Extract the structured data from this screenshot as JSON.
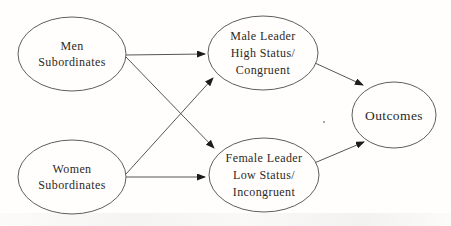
{
  "figure": {
    "background_color": "#fffefd",
    "ellipse_stroke_color": "#5e5e5e",
    "arrow_line_color": "#555555",
    "arrowhead_color": "#1c1c1c",
    "text_color": "#2d2925",
    "nodes": [
      {
        "id": "men-subordinates",
        "label_lines": [
          "Men",
          "Subordinates"
        ],
        "cx": 72,
        "cy": 54,
        "rx": 54,
        "ry": 37
      },
      {
        "id": "women-subordinates",
        "label_lines": [
          "Women",
          "Subordinates"
        ],
        "cx": 72,
        "cy": 177,
        "rx": 54,
        "ry": 37
      },
      {
        "id": "male-leader",
        "label_lines": [
          "Male Leader",
          "High Status/",
          "Congruent"
        ],
        "cx": 263,
        "cy": 53,
        "rx": 55,
        "ry": 37
      },
      {
        "id": "female-leader",
        "label_lines": [
          "Female Leader",
          "Low Status/",
          "Incongruent"
        ],
        "cx": 264,
        "cy": 175,
        "rx": 55,
        "ry": 37
      },
      {
        "id": "outcomes",
        "label_lines": [
          "Outcomes"
        ],
        "cx": 394,
        "cy": 115,
        "rx": 42,
        "ry": 33
      }
    ],
    "edges": [
      {
        "from": "men-subordinates",
        "to": "male-leader",
        "x1": 126,
        "y1": 55,
        "x2": 205,
        "y2": 54
      },
      {
        "from": "men-subordinates",
        "to": "female-leader",
        "x1": 126,
        "y1": 57,
        "x2": 214,
        "y2": 148
      },
      {
        "from": "women-subordinates",
        "to": "male-leader",
        "x1": 126,
        "y1": 174,
        "x2": 213,
        "y2": 78
      },
      {
        "from": "women-subordinates",
        "to": "female-leader",
        "x1": 126,
        "y1": 177,
        "x2": 205,
        "y2": 177
      },
      {
        "from": "male-leader",
        "to": "outcomes",
        "x1": 315,
        "y1": 63,
        "x2": 363,
        "y2": 85
      },
      {
        "from": "female-leader",
        "to": "outcomes",
        "x1": 312,
        "y1": 164,
        "x2": 364,
        "y2": 142
      }
    ],
    "speck": {
      "x": 324,
      "y": 122
    }
  }
}
